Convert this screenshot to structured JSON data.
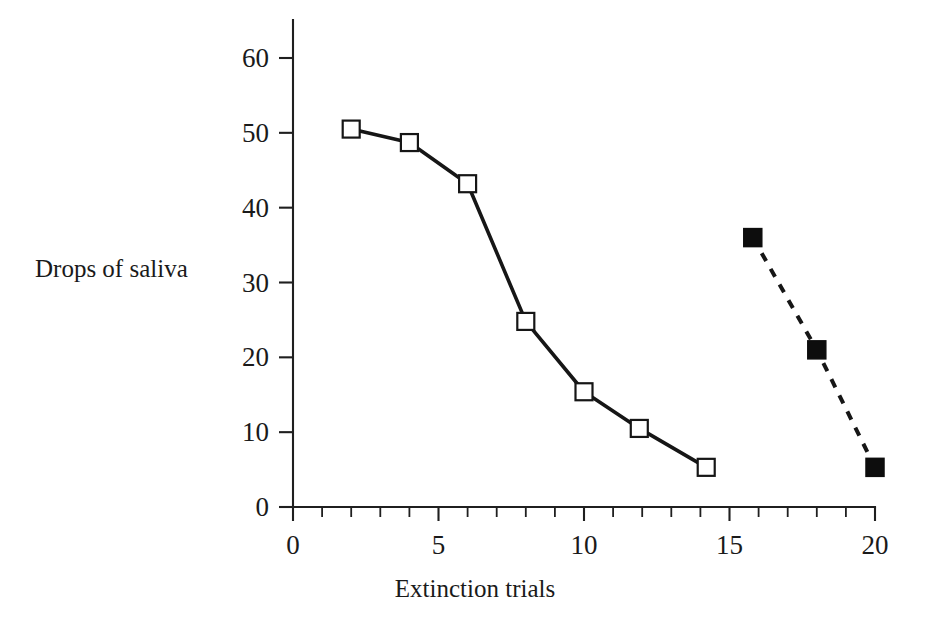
{
  "chart_data": {
    "type": "line",
    "title": "",
    "subtitle": "",
    "xlabel": "Extinction trials",
    "ylabel": "Drops of saliva",
    "xlim": [
      0,
      20
    ],
    "ylim": [
      0,
      62
    ],
    "grid": false,
    "legend_position": "none",
    "x_ticks": [
      0,
      5,
      10,
      15,
      20
    ],
    "x_tick_labels": [
      "0",
      "5",
      "10",
      "15",
      "20"
    ],
    "x_minor_ticks": [
      1,
      2,
      3,
      4,
      6,
      7,
      8,
      9,
      11,
      12,
      13,
      14,
      16,
      17,
      18,
      19
    ],
    "y_ticks": [
      0,
      10,
      20,
      30,
      40,
      50,
      60
    ],
    "y_tick_labels": [
      "0",
      "10",
      "20",
      "30",
      "40",
      "50",
      "60"
    ],
    "series": [
      {
        "name": "extinction",
        "marker": "open-square",
        "linestyle": "solid",
        "color": "#161616",
        "points": [
          {
            "x": 2.0,
            "y": 50.5
          },
          {
            "x": 4.0,
            "y": 48.7
          },
          {
            "x": 6.0,
            "y": 43.2
          },
          {
            "x": 8.0,
            "y": 24.8
          },
          {
            "x": 10.0,
            "y": 15.4
          },
          {
            "x": 11.9,
            "y": 10.5
          },
          {
            "x": 14.2,
            "y": 5.3
          }
        ]
      },
      {
        "name": "spontaneous-recovery",
        "marker": "filled-square",
        "linestyle": "dashed",
        "color": "#0d0d0d",
        "points": [
          {
            "x": 15.8,
            "y": 36.0
          },
          {
            "x": 18.0,
            "y": 21.0
          },
          {
            "x": 20.0,
            "y": 5.3
          }
        ]
      }
    ]
  },
  "labels": {
    "y_axis_title": "Drops of saliva",
    "x_axis_title": "Extinction trials"
  }
}
